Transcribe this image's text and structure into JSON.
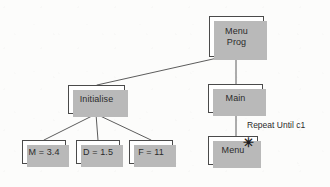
{
  "diagram": {
    "background_color": "#fcfcfb",
    "box_fill": "#ffffff",
    "box_border_color": "#4a4a4a",
    "shadow_color": "#b9b9b9",
    "text_color": "#2b2b2b",
    "nodes": [
      {
        "id": "menu-prog",
        "label": "Menu\nProg",
        "x": 209,
        "y": 16,
        "w": 55,
        "h": 41
      },
      {
        "id": "initialise",
        "label": "Initialise",
        "x": 68,
        "y": 85,
        "w": 57,
        "h": 29
      },
      {
        "id": "main",
        "label": "Main",
        "x": 208,
        "y": 84,
        "w": 55,
        "h": 29
      },
      {
        "id": "m-assign",
        "label": "M = 3.4",
        "x": 22,
        "y": 140,
        "w": 44,
        "h": 24
      },
      {
        "id": "d-assign",
        "label": "D = 1.5",
        "x": 76,
        "y": 140,
        "w": 44,
        "h": 24
      },
      {
        "id": "f-assign",
        "label": "F = 11",
        "x": 129,
        "y": 140,
        "w": 44,
        "h": 24
      },
      {
        "id": "menu",
        "label": "Menu",
        "x": 208,
        "y": 136,
        "w": 50,
        "h": 29
      }
    ],
    "edge_labels": [
      {
        "id": "repeat-until",
        "text": "Repeat Until c1",
        "x": 247,
        "y": 120
      }
    ],
    "markers": [
      {
        "id": "iteration-asterisk",
        "glyph": "✳",
        "x": 243,
        "y": 136
      }
    ],
    "connectors": [
      {
        "id": "prog-to-initialise",
        "from": "menu-prog",
        "to": "initialise",
        "kind": "diagonal"
      },
      {
        "id": "prog-to-main",
        "from": "menu-prog",
        "to": "main",
        "kind": "vertical"
      },
      {
        "id": "main-to-menu",
        "from": "main",
        "to": "menu",
        "kind": "vertical"
      },
      {
        "id": "init-to-m",
        "from": "initialise",
        "to": "m-assign",
        "kind": "fan"
      },
      {
        "id": "init-to-d",
        "from": "initialise",
        "to": "d-assign",
        "kind": "fan"
      },
      {
        "id": "init-to-f",
        "from": "initialise",
        "to": "f-assign",
        "kind": "fan"
      }
    ]
  }
}
